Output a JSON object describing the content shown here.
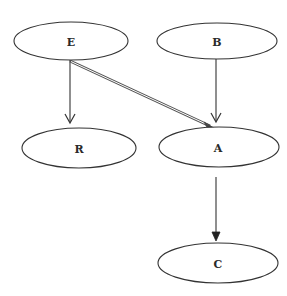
{
  "diagram": {
    "type": "directed-graph",
    "nodes": [
      {
        "id": "E",
        "label": "E",
        "cx": 71,
        "cy": 41,
        "rx": 57,
        "ry": 19
      },
      {
        "id": "B",
        "label": "B",
        "cx": 217,
        "cy": 41,
        "rx": 60,
        "ry": 18
      },
      {
        "id": "R",
        "label": "R",
        "cx": 79,
        "cy": 148,
        "rx": 57,
        "ry": 20
      },
      {
        "id": "A",
        "label": "A",
        "cx": 219,
        "cy": 147,
        "rx": 60,
        "ry": 20
      },
      {
        "id": "C",
        "label": "C",
        "cx": 218,
        "cy": 263,
        "rx": 60,
        "ry": 20
      }
    ],
    "edges": [
      {
        "from": "E",
        "to": "R",
        "style": "single",
        "head": "open"
      },
      {
        "from": "B",
        "to": "A",
        "style": "single",
        "head": "open"
      },
      {
        "from": "E",
        "to": "A",
        "style": "double",
        "head": "filled"
      },
      {
        "from": "A",
        "to": "C",
        "style": "single",
        "head": "filled"
      }
    ],
    "colors": {
      "stroke": "#333333",
      "background": "#ffffff",
      "label": "#2a2a2a"
    }
  }
}
